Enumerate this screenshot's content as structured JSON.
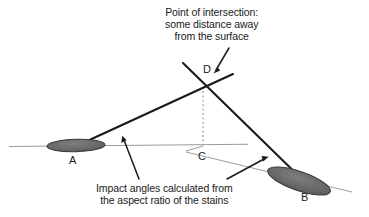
{
  "diagram": {
    "title_annotation": {
      "name": "point-of-intersection-caption",
      "lines": [
        "Point of intersection:",
        "some distance away",
        "from the surface"
      ],
      "line1": "Point of intersection:",
      "line2": "some distance away",
      "line3": "from the surface"
    },
    "bottom_annotation": {
      "name": "impact-angles-caption",
      "lines": [
        "Impact angles calculated from",
        "the aspect ratio of the stains"
      ],
      "line1": "Impact angles calculated from",
      "line2": "the aspect ratio of the stains"
    },
    "points": {
      "a": "A",
      "b": "B",
      "c": "C",
      "d": "D"
    },
    "colors": {
      "background": "#ffffff",
      "stain_fill": "#6b6b6b",
      "stain_stroke": "#2b2b2b",
      "trajectory_line": "#1a1a1a",
      "surface_line": "#8e8e8e",
      "dotted_line": "#8e8e8e",
      "text": "#1a1a1a"
    },
    "geometry": {
      "intersection_point": {
        "x": 203,
        "y": 89
      },
      "surface_point_c": {
        "x": 203,
        "y": 146
      },
      "stain_a_center": {
        "x": 76,
        "y": 145
      },
      "stain_b_center": {
        "x": 299,
        "y": 181
      },
      "surface_line_start": {
        "x": 9,
        "y": 146
      },
      "surface_line_end": {
        "x": 248,
        "y": 144
      }
    }
  }
}
